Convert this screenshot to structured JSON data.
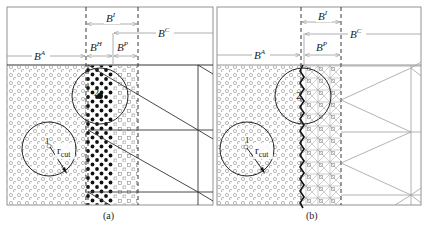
{
  "figure": {
    "panels": [
      {
        "id": "a",
        "caption": "(a)",
        "labels": {
          "BI": {
            "base": "B",
            "sup": "I"
          },
          "BC": {
            "base": "B",
            "sup": "C"
          },
          "BA": {
            "base": "B",
            "sup": "A"
          },
          "BH": {
            "base": "B",
            "sup": "H"
          },
          "BP": {
            "base": "B",
            "sup": "P"
          }
        },
        "circle_labels": {
          "atom1": "1",
          "atom2": "2",
          "rcut_base": "r",
          "rcut_sub": "cut"
        }
      },
      {
        "id": "b",
        "caption": "(b)",
        "labels": {
          "BI": {
            "base": "B",
            "sup": "I"
          },
          "BC": {
            "base": "B",
            "sup": "C"
          },
          "BA": {
            "base": "B",
            "sup": "A"
          },
          "BP": {
            "base": "B",
            "sup": "P"
          }
        },
        "circle_labels": {
          "atom1": "1",
          "atom2": "2",
          "rcut_base": "r",
          "rcut_sub": "cut"
        }
      }
    ],
    "colors": {
      "line": "#2a2a2a",
      "arrow": "#9a9a9a",
      "atom_open": "#8a8a8a",
      "atom_filled": "#111111",
      "mesh": "#8c8c8c",
      "frame": "#555555"
    }
  }
}
